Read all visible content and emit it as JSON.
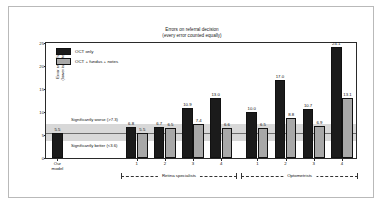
{
  "chart_data": {
    "type": "bar",
    "title": "Errors on referral decision",
    "subtitle": "(every error counted equally)",
    "xlabel": "",
    "ylabel": "Error rate (%)",
    "ylabel2": "(lower is better)",
    "ylim": [
      0,
      25
    ],
    "yticks": [
      0,
      5,
      10,
      15,
      20,
      25
    ],
    "grid": false,
    "legend_position": "top-left",
    "legend": [
      {
        "name": "OCT only",
        "color": "#1b1b1b"
      },
      {
        "name": "OCT + fundus + notes",
        "color": "#a8a8a8"
      }
    ],
    "series": [
      {
        "name": "OCT only",
        "color": "#1b1b1b",
        "values": [
          5.5,
          6.8,
          6.7,
          10.9,
          13.0,
          10.0,
          17.0,
          10.7,
          24.1
        ]
      },
      {
        "name": "OCT + fundus + notes",
        "color": "#a8a8a8",
        "values": [
          null,
          5.5,
          6.5,
          7.4,
          6.6,
          6.5,
          8.8,
          6.9,
          13.1
        ]
      }
    ],
    "categories": [
      "Our model",
      "1",
      "2",
      "3",
      "4",
      "1",
      "2",
      "3",
      "4"
    ],
    "groups": [
      {
        "label": "Retina specialists",
        "members": [
          "1",
          "2",
          "3",
          "4"
        ]
      },
      {
        "label": "Optometrists",
        "members": [
          "1",
          "2",
          "3",
          "4"
        ]
      }
    ],
    "annotations": [
      {
        "text": "Significantly worse (>7.3)",
        "threshold": 7.3
      },
      {
        "text": "Significantly better (<3.6)",
        "threshold": 3.6
      },
      {
        "text": "reference line",
        "value": 5.5
      }
    ],
    "bands": {
      "lower": 3.6,
      "upper": 7.3,
      "reference": 5.5,
      "color": "#c9c9c9"
    }
  },
  "axis": {
    "y_label_line1": "Error rate (%)",
    "y_label_line2": "(lower is better)",
    "ticks": [
      "0",
      "5",
      "10",
      "15",
      "20",
      "25"
    ]
  },
  "ourmodel": {
    "line1": "Our",
    "line2": "model"
  }
}
